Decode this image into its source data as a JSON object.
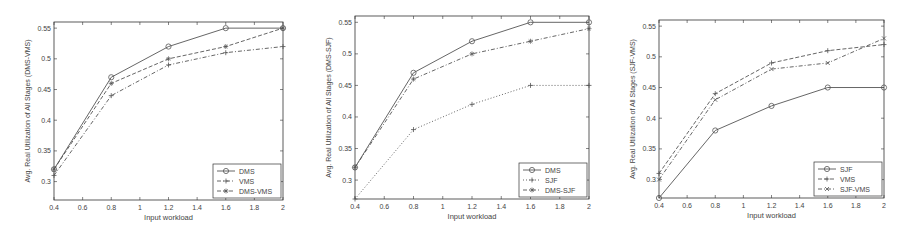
{
  "chart_data": [
    {
      "type": "line",
      "title": "",
      "xlabel": "Input workload",
      "ylabel": "Avg. Real Utilization of All Stages (DMS-VMS)",
      "x": [
        0.4,
        0.8,
        1.2,
        1.6,
        2.0
      ],
      "xlim": [
        0.4,
        2.0
      ],
      "ylim": [
        0.27,
        0.56
      ],
      "xticks": [
        "0.4",
        "0.6",
        "0.8",
        "1",
        "1.2",
        "1.4",
        "1.6",
        "1.8",
        "2"
      ],
      "yticks": [
        "0.3",
        "0.35",
        "0.4",
        "0.45",
        "0.5",
        "0.55"
      ],
      "grid": false,
      "legend_position": "lower right",
      "series": [
        {
          "name": "DMS",
          "values": [
            0.32,
            0.47,
            0.52,
            0.55,
            0.55
          ],
          "marker": "o",
          "dash": "solid"
        },
        {
          "name": "VMS",
          "values": [
            0.31,
            0.44,
            0.49,
            0.51,
            0.52
          ],
          "marker": "+",
          "dash": "dashdot"
        },
        {
          "name": "DMS-VMS",
          "values": [
            0.32,
            0.46,
            0.5,
            0.52,
            0.55
          ],
          "marker": "*",
          "dash": "dashed"
        }
      ]
    },
    {
      "type": "line",
      "title": "",
      "xlabel": "Input workload",
      "ylabel": "Avg. Real Utilization of All Stages (DMS-SJF)",
      "x": [
        0.4,
        0.8,
        1.2,
        1.6,
        2.0
      ],
      "xlim": [
        0.4,
        2.0
      ],
      "ylim": [
        0.27,
        0.56
      ],
      "xticks": [
        "0.4",
        "0.6",
        "0.8",
        "1",
        "1.2",
        "1.4",
        "1.6",
        "1.8",
        "2"
      ],
      "yticks": [
        "0.3",
        "0.35",
        "0.4",
        "0.45",
        "0.5",
        "0.55"
      ],
      "grid": false,
      "legend_position": "lower right",
      "series": [
        {
          "name": "DMS",
          "values": [
            0.32,
            0.47,
            0.52,
            0.55,
            0.55
          ],
          "marker": "o",
          "dash": "solid"
        },
        {
          "name": "SJF",
          "values": [
            0.27,
            0.38,
            0.42,
            0.45,
            0.45
          ],
          "marker": "+",
          "dash": "dotted"
        },
        {
          "name": "DMS-SJF",
          "values": [
            0.32,
            0.46,
            0.5,
            0.52,
            0.54
          ],
          "marker": "*",
          "dash": "dashdot"
        }
      ]
    },
    {
      "type": "line",
      "title": "",
      "xlabel": "Input workload",
      "ylabel": "Avg. Real Utilization of All Stages (SJF-VMS)",
      "x": [
        0.4,
        0.8,
        1.2,
        1.6,
        2.0
      ],
      "xlim": [
        0.4,
        2.0
      ],
      "ylim": [
        0.27,
        0.56
      ],
      "xticks": [
        "0.4",
        "0.6",
        "0.8",
        "1",
        "1.2",
        "1.4",
        "1.6",
        "1.8",
        "2"
      ],
      "yticks": [
        "0.3",
        "0.35",
        "0.4",
        "0.45",
        "0.5",
        "0.55"
      ],
      "grid": false,
      "legend_position": "lower right",
      "series": [
        {
          "name": "SJF",
          "values": [
            0.27,
            0.38,
            0.42,
            0.45,
            0.45
          ],
          "marker": "o",
          "dash": "solid"
        },
        {
          "name": "VMS",
          "values": [
            0.31,
            0.44,
            0.49,
            0.51,
            0.52
          ],
          "marker": "+",
          "dash": "dashed"
        },
        {
          "name": "SJF-VMS",
          "values": [
            0.3,
            0.43,
            0.48,
            0.49,
            0.53
          ],
          "marker": "x",
          "dash": "dashdot"
        }
      ]
    }
  ],
  "layout": [
    {
      "left": 54,
      "right": 283,
      "top": 22,
      "bottom": 200
    },
    {
      "left": 355,
      "right": 589,
      "top": 16,
      "bottom": 199
    },
    {
      "left": 659,
      "right": 884,
      "top": 20,
      "bottom": 198
    }
  ],
  "colors": {
    "axis": "#333333",
    "line": "#555555",
    "text": "#444444"
  }
}
